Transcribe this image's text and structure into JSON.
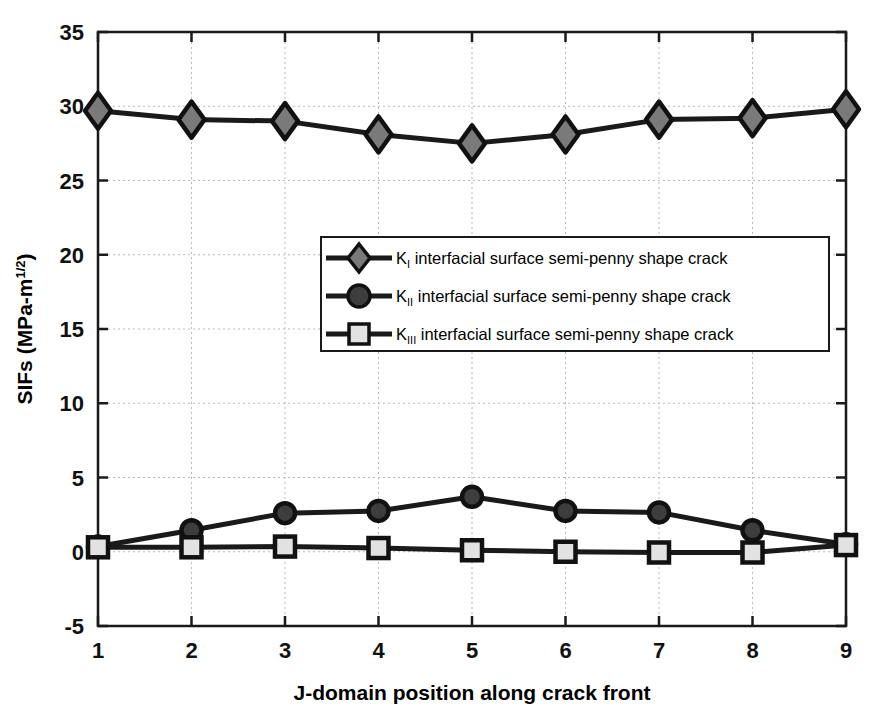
{
  "chart_data": {
    "type": "line",
    "title": "",
    "xlabel": "J-domain position along crack front",
    "ylabel": "SIFs (MPa-m",
    "ylabel_sup": "1/2",
    "ylabel_tail": ")",
    "x": [
      1,
      2,
      3,
      4,
      5,
      6,
      7,
      8,
      9
    ],
    "xticklabels": [
      "1",
      "2",
      "3",
      "4",
      "5",
      "6",
      "7",
      "8",
      "9"
    ],
    "yticklabels": [
      "-5",
      "0",
      "5",
      "10",
      "15",
      "20",
      "25",
      "30",
      "35"
    ],
    "yticks": [
      -5,
      0,
      5,
      10,
      15,
      20,
      25,
      30,
      35
    ],
    "xlim": [
      1,
      9
    ],
    "ylim": [
      -5,
      35
    ],
    "grid": true,
    "legend_position": "center-right",
    "series": [
      {
        "name": "K_I interfacial surface semi-penny shape crack",
        "symbol": "K",
        "subscript": "I",
        "label_rest": " interfacial surface semi-penny shape crack",
        "marker": "diamond",
        "marker_fill": "#7a7a7a",
        "line_color": "#1a1a1a",
        "values": [
          29.7,
          29.1,
          29.0,
          28.1,
          27.5,
          28.1,
          29.1,
          29.2,
          29.8
        ]
      },
      {
        "name": "K_II interfacial surface semi-penny shape crack",
        "symbol": "K",
        "subscript": "II",
        "label_rest": " interfacial surface semi-penny shape crack",
        "marker": "circle",
        "marker_fill": "#3d3d3d",
        "line_color": "#1a1a1a",
        "values": [
          0.35,
          1.45,
          2.6,
          2.75,
          3.7,
          2.75,
          2.65,
          1.45,
          0.5
        ]
      },
      {
        "name": "K_III interfacial surface semi-penny shape crack",
        "symbol": "K",
        "subscript": "III",
        "label_rest": " interfacial surface semi-penny shape crack",
        "marker": "square",
        "marker_fill": "#e2e2e2",
        "line_color": "#1a1a1a",
        "values": [
          0.3,
          0.3,
          0.35,
          0.25,
          0.1,
          0.0,
          -0.05,
          -0.05,
          0.45
        ]
      }
    ],
    "colors": {
      "axis": "#1a1a1a",
      "grid": "#b9b9b9",
      "background": "#ffffff",
      "series_line": "#1a1a1a"
    }
  }
}
